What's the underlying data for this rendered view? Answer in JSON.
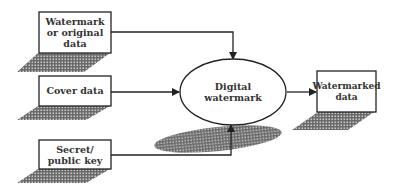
{
  "diagram": {
    "nodes": {
      "watermark_input": {
        "lines": [
          "Watermark",
          "or original",
          "data"
        ]
      },
      "cover_data": {
        "lines": [
          "Cover data"
        ]
      },
      "key": {
        "lines": [
          "Secret/",
          "public key"
        ]
      },
      "process": {
        "lines": [
          "Digital",
          "watermark"
        ]
      },
      "output": {
        "lines": [
          "Watermarked",
          "data"
        ]
      }
    },
    "edges": [
      {
        "from": "watermark_input",
        "to": "process"
      },
      {
        "from": "cover_data",
        "to": "process"
      },
      {
        "from": "key",
        "to": "process"
      },
      {
        "from": "process",
        "to": "output"
      }
    ],
    "colors": {
      "stroke": "#222222",
      "text": "#333333",
      "shadow": "#7a7a7a"
    }
  }
}
